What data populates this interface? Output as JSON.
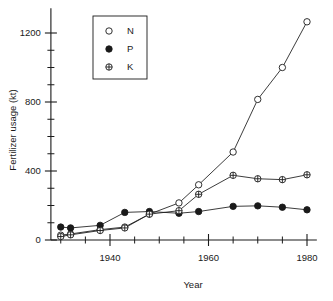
{
  "chart_data": {
    "type": "line",
    "title": "",
    "subtitle": "",
    "xlabel": "Year",
    "ylabel": "Fertilizer usage (kt)",
    "xlim": [
      1928,
      1982
    ],
    "ylim": [
      0,
      1320
    ],
    "grid": false,
    "legend_position": "top-left",
    "x_ticks_major": [
      1940,
      1960,
      1980
    ],
    "x_tick_labels": [
      "1940",
      "1960",
      "1980"
    ],
    "x_ticks_minor": [
      1930,
      1935,
      1945,
      1950,
      1955,
      1965,
      1970,
      1975
    ],
    "y_ticks_major": [
      0,
      400,
      800,
      1200
    ],
    "y_tick_labels": [
      "0",
      "400",
      "800",
      "1200"
    ],
    "y_ticks_minor": [
      100,
      200,
      300,
      500,
      600,
      700,
      900,
      1000,
      1100
    ],
    "series": [
      {
        "name": "N",
        "marker": "open-circle",
        "x": [
          1930,
          1932,
          1938,
          1943,
          1948,
          1954,
          1958,
          1965,
          1970,
          1975,
          1980
        ],
        "values": [
          28,
          35,
          60,
          75,
          150,
          215,
          320,
          510,
          815,
          1000,
          1265
        ]
      },
      {
        "name": "P",
        "marker": "filled-circle",
        "x": [
          1930,
          1932,
          1938,
          1943,
          1948,
          1954,
          1958,
          1965,
          1970,
          1975,
          1980
        ],
        "values": [
          75,
          70,
          85,
          160,
          165,
          155,
          165,
          195,
          198,
          190,
          175
        ]
      },
      {
        "name": "K",
        "marker": "cross-circle",
        "x": [
          1930,
          1932,
          1938,
          1943,
          1948,
          1954,
          1958,
          1965,
          1970,
          1975,
          1980
        ],
        "values": [
          20,
          30,
          55,
          70,
          150,
          170,
          265,
          375,
          355,
          350,
          378
        ]
      }
    ],
    "legend_entries": [
      {
        "label": "N",
        "marker": "open-circle"
      },
      {
        "label": "P",
        "marker": "filled-circle"
      },
      {
        "label": "K",
        "marker": "cross-circle"
      }
    ],
    "colors": {
      "axis": "#1a1a1a",
      "line": "#1a1a1a",
      "marker_fill_open": "#ffffff",
      "marker_fill_solid": "#1a1a1a",
      "background": "#ffffff"
    }
  }
}
